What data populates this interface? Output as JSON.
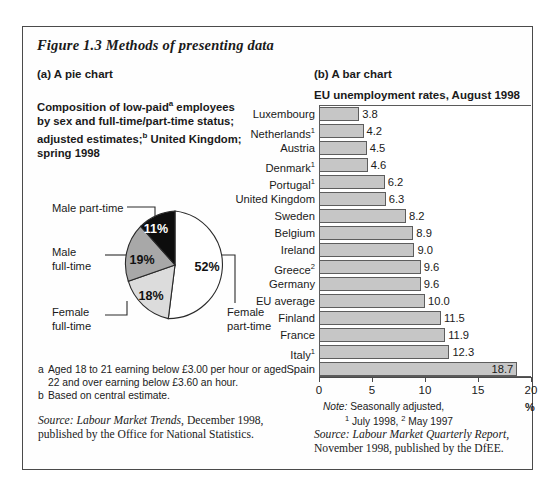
{
  "figure": {
    "caption": "Figure 1.3  Methods of presenting data"
  },
  "panel_a": {
    "label": "(a) A pie chart",
    "title_line1": "Composition of low-paid",
    "title_sup1": "a",
    "title_line1b": " employees",
    "title_line2": "by sex and full-time/part-time status;",
    "title_line3": "adjusted estimates;",
    "title_sup2": "b",
    "title_line3b": " United Kingdom;",
    "title_line4": "spring 1998",
    "callouts": {
      "male_part_time": "Male part-time",
      "male_full_time_l1": "Male",
      "male_full_time_l2": "full-time",
      "female_full_time_l1": "Female",
      "female_full_time_l2": "full-time",
      "female_part_time_l1": "Female",
      "female_part_time_l2": "part-time"
    },
    "footnotes": [
      {
        "marker": "a",
        "text": "Aged 18 to 21 earning below £3.00 per hour or aged 22 and over earning below £3.60 an hour."
      },
      {
        "marker": "b",
        "text": "Based on central estimate."
      }
    ],
    "source_prefix": "Source: Labour Market Trends",
    "source_rest": ", December 1998, published by the Office for National Statistics."
  },
  "panel_b": {
    "label": "(b) A bar chart",
    "title": "EU unemployment rates, August 1998",
    "note_prefix": "Note:",
    "note_text": " Seasonally adjusted,",
    "note_line2_sup1": "1",
    "note_line2_a": " July 1998, ",
    "note_line2_sup2": "2",
    "note_line2_b": " May 1997",
    "percent_symbol": "%",
    "source_prefix": "Source: Labour Market Quarterly Report",
    "source_rest": ", November 1998, published by the DfEE."
  },
  "colors": {
    "bar_fill": "#c6c6c6",
    "bar_stroke": "#5d5d5d",
    "pie_male_part_time": "#0d0d0d",
    "pie_male_full_time": "#a8a8a8",
    "pie_female_full_time": "#dcdcdc",
    "pie_female_part_time": "#ffffff",
    "frame": "#4a4a4a"
  },
  "chart_data": [
    {
      "type": "pie",
      "title": "Composition of low-paid employees by sex and full-time/part-time status; adjusted estimates; United Kingdom; spring 1998",
      "labels": [
        "Male part-time",
        "Male full-time",
        "Female full-time",
        "Female part-time"
      ],
      "values": [
        11,
        19,
        18,
        52
      ],
      "value_labels": [
        "11%",
        "19%",
        "18%",
        "52%"
      ],
      "slice_colors": [
        "#0d0d0d",
        "#a8a8a8",
        "#dcdcdc",
        "#ffffff"
      ],
      "unit": "percent",
      "legend": "callout-labels"
    },
    {
      "type": "bar",
      "orientation": "horizontal",
      "title": "EU unemployment rates, August 1998",
      "xlabel": "%",
      "ylabel": "",
      "xlim": [
        0,
        20
      ],
      "xticks": [
        0,
        5,
        10,
        15,
        20
      ],
      "grid": false,
      "categories": [
        "Luxembourg",
        "Netherlands",
        "Austria",
        "Denmark",
        "Portugal",
        "United Kingdom",
        "Sweden",
        "Belgium",
        "Ireland",
        "Greece",
        "Germany",
        "EU average",
        "Finland",
        "France",
        "Italy",
        "Spain"
      ],
      "category_superscripts": [
        "",
        "1",
        "",
        "1",
        "1",
        "",
        "",
        "",
        "",
        "2",
        "",
        "",
        "",
        "",
        "1",
        ""
      ],
      "values": [
        3.8,
        4.2,
        4.5,
        4.6,
        6.2,
        6.3,
        8.2,
        8.9,
        9.0,
        9.6,
        9.6,
        10.0,
        11.5,
        11.9,
        12.3,
        18.7
      ],
      "value_labels": [
        "3.8",
        "4.2",
        "4.5",
        "4.6",
        "6.2",
        "6.3",
        "8.2",
        "8.9",
        "9.0",
        "9.6",
        "9.6",
        "10.0",
        "11.5",
        "11.9",
        "12.3",
        "18.7"
      ],
      "label_placement": [
        "outside",
        "outside",
        "outside",
        "outside",
        "outside",
        "outside",
        "outside",
        "outside",
        "outside",
        "outside",
        "outside",
        "outside",
        "outside",
        "outside",
        "outside",
        "inside"
      ]
    }
  ]
}
